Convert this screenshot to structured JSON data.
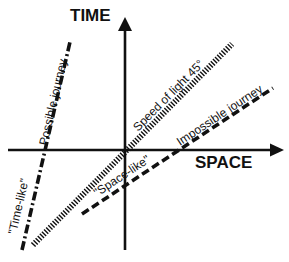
{
  "diagram": {
    "axes": {
      "vertical_label": "TIME",
      "horizontal_label": "SPACE"
    },
    "lines": [
      {
        "id": "speed-of-light",
        "label": "Speed of light  45°",
        "style": "hatched"
      },
      {
        "id": "possible-journey",
        "label": "Possible journey",
        "style": "dash-dot"
      },
      {
        "id": "impossible-journey",
        "label": "Impossible journey",
        "style": "dashed"
      }
    ],
    "region_labels": {
      "time_like": "\"Time-like\"",
      "space_like": "\"Space-like\""
    },
    "colors": {
      "ink": "#111111",
      "background": "#ffffff"
    }
  }
}
